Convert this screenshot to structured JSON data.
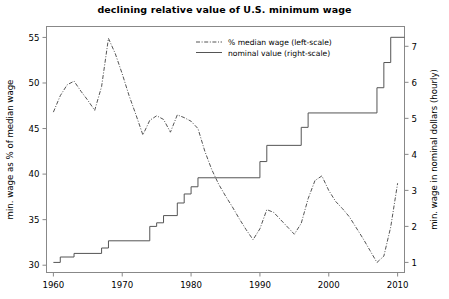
{
  "chart_data": {
    "type": "line",
    "title": "declining relative value of U.S. minimum wage",
    "xlabel": "",
    "ylabel": "min. wage as % of median wage",
    "ylabel_right": "min. wage in nominal dollars (hourly)",
    "xlim": [
      1959,
      2011
    ],
    "ylim": [
      29.2,
      56.2
    ],
    "ylim_right": [
      0.72,
      7.55
    ],
    "xticks": [
      1960,
      1970,
      1980,
      1990,
      2000,
      2010
    ],
    "xtick_labels": [
      "1960",
      "1970",
      "1980",
      "1990",
      "2000",
      "2010"
    ],
    "yticks": [
      30,
      35,
      40,
      45,
      50,
      55
    ],
    "ytick_labels": [
      "30",
      "35",
      "40",
      "45",
      "50",
      "55"
    ],
    "yticks_right": [
      1,
      2,
      3,
      4,
      5,
      6,
      7
    ],
    "ytick_labels_right": [
      "1",
      "2",
      "3",
      "4",
      "5",
      "6",
      "7"
    ],
    "grid": false,
    "legend_position": "upper center",
    "series": [
      {
        "name": "% median wage (left-scale)",
        "axis": "left",
        "style": "dashdot",
        "color": "#555555",
        "x": [
          1960,
          1961,
          1962,
          1963,
          1964,
          1965,
          1966,
          1967,
          1968,
          1969,
          1970,
          1971,
          1972,
          1973,
          1974,
          1975,
          1976,
          1977,
          1978,
          1979,
          1980,
          1981,
          1982,
          1983,
          1984,
          1985,
          1986,
          1987,
          1988,
          1989,
          1990,
          1991,
          1992,
          1993,
          1994,
          1995,
          1996,
          1997,
          1998,
          1999,
          2000,
          2001,
          2002,
          2003,
          2004,
          2005,
          2006,
          2007,
          2008,
          2009,
          2010
        ],
        "values": [
          46.8,
          48.6,
          49.8,
          50.2,
          49.1,
          48.1,
          47.0,
          49.6,
          54.9,
          53.2,
          51.0,
          48.6,
          46.5,
          44.3,
          45.9,
          46.4,
          46.0,
          44.6,
          46.5,
          46.2,
          45.8,
          45.0,
          42.5,
          40.5,
          38.9,
          37.6,
          36.4,
          35.1,
          33.9,
          32.8,
          34.0,
          36.1,
          35.8,
          35.0,
          34.2,
          33.4,
          34.6,
          37.3,
          39.3,
          39.8,
          38.2,
          37.0,
          36.2,
          35.3,
          34.1,
          32.9,
          31.6,
          30.3,
          31.0,
          34.2,
          39.0
        ]
      },
      {
        "name": "nominal value (right-scale)",
        "axis": "right",
        "style": "solid",
        "color": "#555555",
        "step": "post",
        "x": [
          1960,
          1961,
          1963,
          1967,
          1968,
          1974,
          1975,
          1976,
          1978,
          1979,
          1980,
          1981,
          1990,
          1991,
          1996,
          1997,
          2007,
          2008,
          2009,
          2011
        ],
        "values": [
          1.0,
          1.15,
          1.25,
          1.4,
          1.6,
          2.0,
          2.1,
          2.3,
          2.65,
          2.9,
          3.1,
          3.35,
          3.8,
          4.25,
          4.75,
          5.15,
          5.85,
          6.55,
          7.25,
          7.25
        ]
      }
    ]
  }
}
